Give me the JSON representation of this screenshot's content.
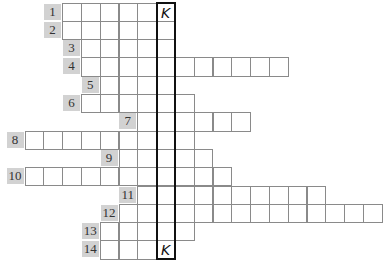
{
  "puzzle": {
    "type": "crossword-keyword-grid",
    "key_column_index": 7,
    "key_letter_top": "K",
    "key_letter_bottom": "K",
    "colors": {
      "label_bg": "#d2d2d2",
      "cell_border": "#8a8a8a",
      "key_border": "#111111"
    },
    "rows": [
      {
        "number": "1",
        "start_col": 2,
        "end_col": 7
      },
      {
        "number": "2",
        "start_col": 2,
        "end_col": 7
      },
      {
        "number": "3",
        "start_col": 3,
        "end_col": 7
      },
      {
        "number": "4",
        "start_col": 3,
        "end_col": 13
      },
      {
        "number": "5",
        "start_col": 4,
        "end_col": 7
      },
      {
        "number": "6",
        "start_col": 3,
        "end_col": 8
      },
      {
        "number": "7",
        "start_col": 6,
        "end_col": 11
      },
      {
        "number": "8",
        "start_col": 0,
        "end_col": 8
      },
      {
        "number": "9",
        "start_col": 5,
        "end_col": 9
      },
      {
        "number": "10",
        "start_col": 0,
        "end_col": 10
      },
      {
        "number": "11",
        "start_col": 6,
        "end_col": 15
      },
      {
        "number": "12",
        "start_col": 5,
        "end_col": 18
      },
      {
        "number": "13",
        "start_col": 4,
        "end_col": 8
      },
      {
        "number": "14",
        "start_col": 4,
        "end_col": 7
      }
    ],
    "filled": [
      {
        "row": 0,
        "col": 7,
        "letter": "K"
      },
      {
        "row": 13,
        "col": 7,
        "letter": "K"
      }
    ]
  }
}
